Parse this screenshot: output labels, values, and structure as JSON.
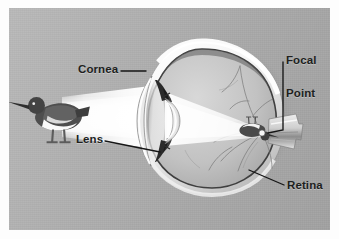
{
  "figure": {
    "background_color": "#b2b2b2",
    "border_color": "#fdfdfd",
    "style": "grayscale anatomical illustration"
  },
  "labels": {
    "cornea": "Cornea",
    "lens": "Lens",
    "focal_point_line1": "Focal",
    "focal_point_line2": "Point",
    "retina": "Retina"
  },
  "objects": {
    "subject": "shorebird",
    "subject_description": "dark-backed wading bird with white belly and long bill",
    "light_beam": "white cone of light from bird to cornea",
    "inverted_image": "inverted bird image formed at the focal point on the retina",
    "optic_nerve": "optic nerve exiting at the rear of the eye"
  },
  "colors": {
    "plate": "#b2b2b2",
    "sclera": "#f2f2f2",
    "choroid": "#4a4a4a",
    "vitreous": "#c9c9c9",
    "beam": "#ffffff",
    "label_text": "#201f1e",
    "leader_line": "#161616"
  }
}
